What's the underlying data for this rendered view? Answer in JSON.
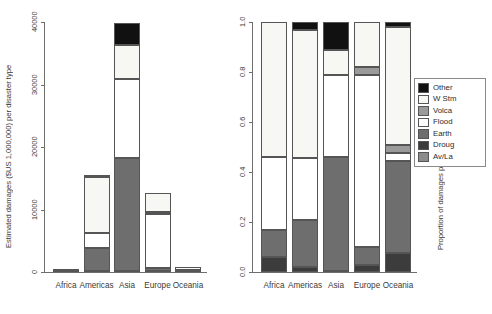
{
  "chart_data": [
    {
      "type": "bar",
      "id": "absolute-damages",
      "title": "",
      "xlabel": "",
      "ylabel": "Estimated damages ($US 1,000,000) per disaster type",
      "ylim": [
        0,
        40000
      ],
      "yticks": [
        0,
        10000,
        20000,
        30000,
        40000
      ],
      "yticklabels": [
        "0",
        "10000",
        "20000",
        "30000",
        "40000"
      ],
      "grid": false,
      "stacked": true,
      "categories": [
        "Africa",
        "Americas",
        "Asia",
        "Europe",
        "Oceania"
      ],
      "series": [
        {
          "name": "Av/La",
          "values": [
            0,
            0,
            0,
            0,
            0
          ]
        },
        {
          "name": "Droug",
          "values": [
            30,
            150,
            200,
            120,
            60
          ]
        },
        {
          "name": "Earth",
          "values": [
            20,
            3650,
            18000,
            480,
            30
          ]
        },
        {
          "name": "Flood",
          "values": [
            80,
            2500,
            12700,
            8700,
            170
          ]
        },
        {
          "name": "Volca",
          "values": [
            0,
            0,
            0,
            250,
            0
          ]
        },
        {
          "name": "W Stm",
          "values": [
            40,
            8900,
            5400,
            3100,
            620
          ]
        },
        {
          "name": "Other",
          "values": [
            0,
            300,
            3500,
            0,
            0
          ]
        }
      ]
    },
    {
      "type": "bar",
      "id": "proportional-damages",
      "title": "",
      "xlabel": "",
      "ylabel": "Proportion of damages per disaster type",
      "ylim": [
        0,
        1.0
      ],
      "yticks": [
        0.0,
        0.2,
        0.4,
        0.6,
        0.8,
        1.0
      ],
      "yticklabels": [
        "0.0",
        "0.2",
        "0.4",
        "0.6",
        "0.8",
        "1.0"
      ],
      "grid": false,
      "stacked": true,
      "normalized": true,
      "categories": [
        "Africa",
        "Americas",
        "Asia",
        "Europe",
        "Oceania"
      ],
      "series": [
        {
          "name": "Av/La",
          "values": [
            0.0,
            0.0,
            0.0,
            0.0,
            0.0
          ]
        },
        {
          "name": "Droug",
          "values": [
            0.06,
            0.02,
            0.005,
            0.03,
            0.075
          ]
        },
        {
          "name": "Earth",
          "values": [
            0.11,
            0.19,
            0.455,
            0.07,
            0.37
          ]
        },
        {
          "name": "Flood",
          "values": [
            0.29,
            0.245,
            0.33,
            0.69,
            0.03
          ]
        },
        {
          "name": "Volca",
          "values": [
            0.0,
            0.0,
            0.0,
            0.03,
            0.035
          ]
        },
        {
          "name": "W Stm",
          "values": [
            0.54,
            0.515,
            0.1,
            0.18,
            0.47
          ]
        },
        {
          "name": "Other",
          "values": [
            0.0,
            0.03,
            0.11,
            0.0,
            0.02
          ]
        }
      ]
    }
  ],
  "legend": {
    "position": "right",
    "items": [
      {
        "label": "Other",
        "color": "#111111"
      },
      {
        "label": "W Stm",
        "color": "#f7f7f4"
      },
      {
        "label": "Volca",
        "color": "#9a9a9a"
      },
      {
        "label": "Flood",
        "color": "#ffffff"
      },
      {
        "label": "Earth",
        "color": "#6e6e6e"
      },
      {
        "label": "Droug",
        "color": "#3c3c3c"
      },
      {
        "label": "Av/La",
        "color": "#8c8c8c"
      }
    ]
  },
  "colors": {
    "other": "#111111",
    "w_stm": "#f7f7f4",
    "volca": "#9a9a9a",
    "flood": "#ffffff",
    "earth": "#6e6e6e",
    "droug": "#3c3c3c",
    "avla": "#8c8c8c",
    "axis": "#6f6f6f",
    "text": "#2b2b2b",
    "background": "#ffffff"
  }
}
